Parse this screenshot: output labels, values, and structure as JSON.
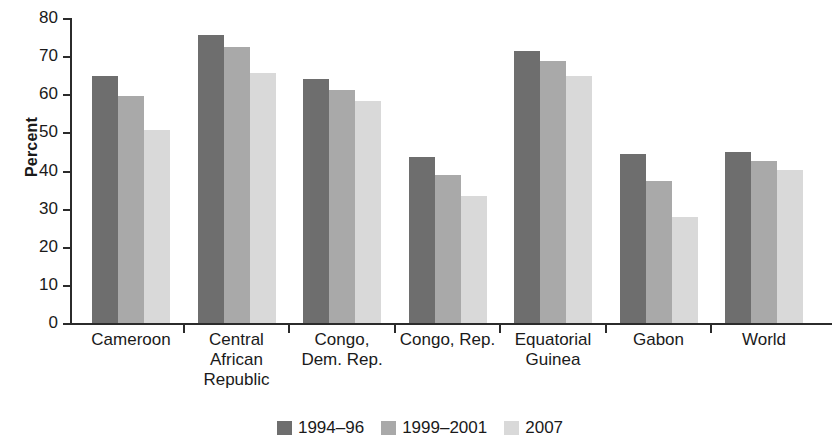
{
  "chart_data": {
    "type": "bar",
    "title": "",
    "xlabel": "",
    "ylabel": "Percent",
    "ylim": [
      0,
      80
    ],
    "ytick_step": 10,
    "yticks": [
      "80",
      "70",
      "60",
      "50",
      "40",
      "30",
      "20",
      "10",
      "0"
    ],
    "grid": false,
    "legend_position": "bottom",
    "categories": [
      "Cameroon",
      "Central\nAfrican\nRepublic",
      "Congo,\nDem. Rep.",
      "Congo, Rep.",
      "Equatorial\nGuinea",
      "Gabon",
      "World"
    ],
    "series": [
      {
        "name": "1994–96",
        "color": "#6e6e6e",
        "values": [
          64.7,
          75.5,
          64.0,
          43.5,
          71.3,
          44.3,
          44.8
        ]
      },
      {
        "name": "1999–2001",
        "color": "#a9a9a9",
        "values": [
          59.5,
          72.5,
          61.0,
          38.9,
          68.8,
          37.2,
          42.6
        ]
      },
      {
        "name": "2007",
        "color": "#d9d9d9",
        "values": [
          50.7,
          65.7,
          58.2,
          33.4,
          64.8,
          27.9,
          40.1
        ]
      }
    ]
  }
}
